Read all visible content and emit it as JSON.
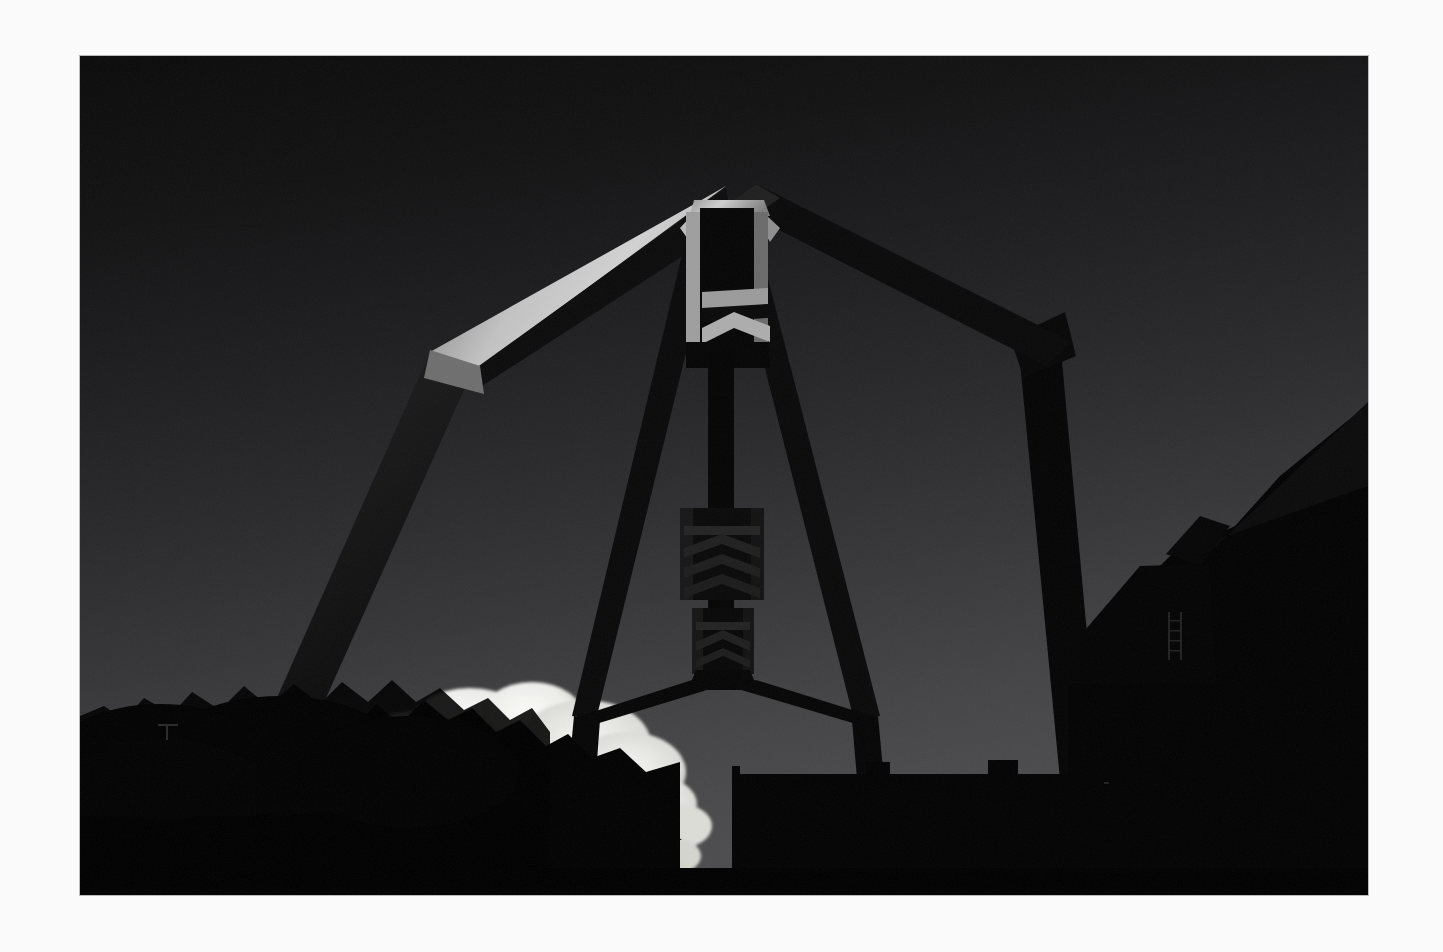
{
  "page": {
    "background_color": "#fafafa",
    "width": 1443,
    "height": 952
  },
  "photo": {
    "frame": {
      "x": 80,
      "y": 56,
      "width": 1288,
      "height": 839
    },
    "border_color": "#000000",
    "subject": "Backlit silhouette of a large industrial steel gantry / arch sculpture against a dark gradient sky at dusk",
    "orientation": "landscape",
    "palette": {
      "sky_top": "#0d0d0e",
      "sky_upper_mid": "#1c1c1e",
      "sky_mid": "#2b2b2d",
      "sky_lower": "#3d3d3f",
      "sky_horizon": "#4a4a4c",
      "silhouette": "#050505",
      "highlight_bright": "#c9c9c9",
      "highlight_mid": "#8c8c8c",
      "highlight_dim": "#5a5a5a",
      "cloud_white": "#f2f2f0",
      "cloud_shadow": "#bdbdba",
      "paper": "#fafafa"
    },
    "elements": [
      {
        "name": "sky-gradient",
        "label": "Dark graduated sky, near black at top to mid grey at horizon"
      },
      {
        "name": "steel-arch-structure",
        "label": "Large A-frame steel gantry with peaked apex and splayed legs"
      },
      {
        "name": "apex-tower",
        "label": "Narrow vertical apex box with flared shoulders at the top of the arch"
      },
      {
        "name": "left-arch-arm",
        "label": "Sunlit upper-left arm of the arch with bright top edge"
      },
      {
        "name": "right-arch-arm",
        "label": "Shadowed upper-right arm of the arch"
      },
      {
        "name": "left-outer-leg",
        "label": "Long left outer leg descending to the tree line"
      },
      {
        "name": "right-outer-leg",
        "label": "Right outer leg descending behind the building"
      },
      {
        "name": "left-inner-strut",
        "label": "Inner diagonal strut from apex to lower-left vertex"
      },
      {
        "name": "right-inner-strut",
        "label": "Inner diagonal strut from apex to lower-right vertex"
      },
      {
        "name": "central-mast",
        "label": "Central vertical mast hanging beneath the apex"
      },
      {
        "name": "mast-lattice-upper",
        "label": "Upper chevron lattice detail on the central mast"
      },
      {
        "name": "mast-lattice-lower",
        "label": "Lower chevron lattice detail on the central mast"
      },
      {
        "name": "lower-v-legs",
        "label": "Lower V-shaped legs splaying from the mast base"
      },
      {
        "name": "cumulus-cloud",
        "label": "Bright sunlit cumulus cloud near the left horizon"
      },
      {
        "name": "tree-line",
        "label": "Dark silhouetted tree canopy along the lower-left"
      },
      {
        "name": "distant-tower",
        "label": "Small distant masonry tower in front of the cloud"
      },
      {
        "name": "roof-lantern",
        "label": "Small rooftop lantern / cupola on the building"
      },
      {
        "name": "flat-roof-building",
        "label": "Flat-roofed industrial building across the bottom centre-right"
      },
      {
        "name": "right-industrial-block",
        "label": "Large angular industrial block filling the right edge"
      },
      {
        "name": "right-ladder",
        "label": "Thin ladder detail on the right industrial block"
      }
    ]
  }
}
